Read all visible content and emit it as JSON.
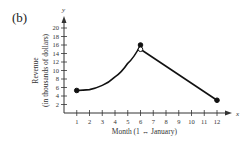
{
  "panel_label": "(b)",
  "chart_data": {
    "type": "line",
    "title": "",
    "xlabel": "Month (1 ↔ January)",
    "ylabel": "Revenue (in thousands of dollars)",
    "ylabel_line1": "Revenue",
    "ylabel_line2": "(in thousands of dollars)",
    "x_axis_name": "x",
    "y_axis_name": "y",
    "xlim": [
      0,
      12.5
    ],
    "ylim": [
      0,
      21
    ],
    "x_ticks": [
      1,
      2,
      3,
      4,
      5,
      6,
      7,
      8,
      9,
      10,
      11,
      12
    ],
    "y_ticks": [
      2,
      4,
      6,
      8,
      10,
      12,
      14,
      16,
      18,
      20
    ],
    "grid": false,
    "series": [
      {
        "name": "segment 1 (curve, 1 ≤ x ≤ 6)",
        "style": "curve",
        "x": [
          1,
          2,
          3,
          4,
          5,
          6
        ],
        "y": [
          5.3,
          5.5,
          6.5,
          8.5,
          11.7,
          16
        ],
        "start_marker": "filled",
        "end_marker": "filled"
      },
      {
        "name": "segment 2 (line, 6 < x ≤ 12)",
        "style": "line",
        "x": [
          6,
          12
        ],
        "y": [
          15,
          3
        ],
        "start_marker": "open",
        "end_marker": "filled"
      }
    ]
  }
}
